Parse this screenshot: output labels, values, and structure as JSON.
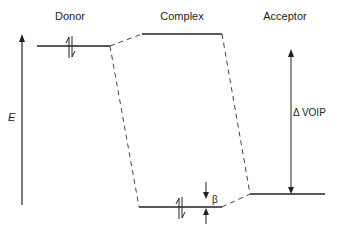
{
  "diagram": {
    "columns": {
      "donor": "Donor",
      "complex": "Complex",
      "acceptor": "Acceptor"
    },
    "axis": {
      "label": "E"
    },
    "annotations": {
      "delta_voip": "Δ VOIP",
      "beta": "β"
    },
    "levels": [
      {
        "name": "donor-level",
        "column": "Donor",
        "occupied": true
      },
      {
        "name": "complex-upper-level",
        "column": "Complex",
        "occupied": false
      },
      {
        "name": "complex-lower-level",
        "column": "Complex",
        "occupied": true
      },
      {
        "name": "acceptor-level",
        "column": "Acceptor",
        "occupied": false
      }
    ],
    "colors": {
      "line": "#222222",
      "background": "#ffffff"
    }
  }
}
